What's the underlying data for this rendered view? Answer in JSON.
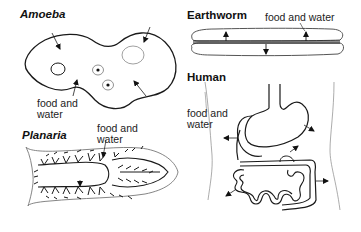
{
  "diagram": {
    "panels": [
      {
        "name": "Amoeba",
        "annotation": [
          "food and",
          "water"
        ]
      },
      {
        "name": "Earthworm",
        "annotation": [
          "food and water"
        ]
      },
      {
        "name": "Planaria",
        "annotation": [
          "food and",
          "water"
        ]
      },
      {
        "name": "Human",
        "annotation": [
          "food and",
          "water"
        ]
      }
    ],
    "stroke_color": "#1a1a1a",
    "background": "#ffffff"
  }
}
